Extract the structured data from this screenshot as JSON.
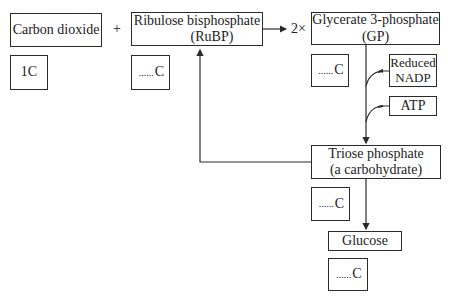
{
  "diagram": {
    "nodes": {
      "carbon_dioxide": {
        "label": "Carbon dioxide",
        "carbon": "1C"
      },
      "plus": "+",
      "rubp": {
        "line1": "Ribulose bisphosphate",
        "line2": "(RuBP)",
        "carbon_blank": "......",
        "carbon_unit": "C"
      },
      "multiplier": "2×",
      "gp": {
        "line1": "Glycerate 3-phosphate",
        "line2": "(GP)",
        "carbon_blank": "......",
        "carbon_unit": "C"
      },
      "reduced_nadp": {
        "line1": "Reduced",
        "line2": "NADP"
      },
      "atp": {
        "label": "ATP"
      },
      "triose": {
        "line1": "Triose phosphate",
        "line2": "(a carbohydrate)",
        "carbon_blank": "......",
        "carbon_unit": "C"
      },
      "glucose": {
        "label": "Glucose",
        "carbon_blank": "......",
        "carbon_unit": "C"
      }
    },
    "edges": [
      {
        "from": "rubp",
        "to": "gp",
        "label": "2×"
      },
      {
        "from": "gp",
        "to": "triose"
      },
      {
        "from": "reduced_nadp",
        "to": "gp-triose-path"
      },
      {
        "from": "atp",
        "to": "gp-triose-path"
      },
      {
        "from": "triose",
        "to": "glucose"
      },
      {
        "from": "triose",
        "to": "rubp"
      }
    ],
    "colors": {
      "line": "#2a2a2a",
      "background": "#ffffff"
    }
  }
}
